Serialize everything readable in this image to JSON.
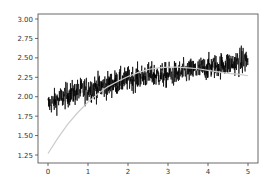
{
  "chart_data": {
    "type": "line",
    "title": "",
    "xlabel": "",
    "ylabel": "",
    "xlim": [
      -0.25,
      5.25
    ],
    "ylim": [
      1.18,
      3.04
    ],
    "xticks": [
      0,
      1,
      2,
      3,
      4,
      5
    ],
    "xtick_labels": [
      "0",
      "1",
      "2",
      "3",
      "4",
      "5"
    ],
    "yticks": [
      1.25,
      1.5,
      1.75,
      2.0,
      2.25,
      2.5,
      2.75,
      3.0
    ],
    "ytick_labels": [
      "1.25",
      "1.50",
      "1.75",
      "2.00",
      "2.25",
      "2.50",
      "2.75",
      "3.00"
    ],
    "grid": false,
    "legend": null,
    "series": [
      {
        "name": "noisy data",
        "color": "#000000",
        "style": "line",
        "description": "dense noisy signal, ~1000 points over x in [0,5], mean rising from ~1.95 to ~2.35, amplitude ~±0.3",
        "envelope": {
          "x": [
            0,
            0.5,
            1,
            1.5,
            2,
            2.5,
            3,
            3.5,
            4,
            4.5,
            5
          ],
          "upper": [
            2.25,
            2.4,
            2.5,
            2.55,
            2.6,
            2.65,
            2.65,
            2.7,
            2.75,
            2.8,
            2.9
          ],
          "lower": [
            1.55,
            1.65,
            1.7,
            1.75,
            1.85,
            1.9,
            1.9,
            1.95,
            2.0,
            2.05,
            2.05
          ]
        }
      },
      {
        "name": "fitted curve",
        "color": "#cccccc",
        "style": "line",
        "x": [
          0,
          0.25,
          0.5,
          0.75,
          1,
          1.25,
          1.5,
          1.75,
          2,
          2.25,
          2.5,
          2.75,
          3,
          3.25,
          3.5,
          3.75,
          4,
          4.25,
          4.5,
          4.75,
          5
        ],
        "y": [
          1.27,
          1.47,
          1.65,
          1.8,
          1.93,
          2.04,
          2.13,
          2.2,
          2.26,
          2.31,
          2.35,
          2.37,
          2.38,
          2.38,
          2.37,
          2.36,
          2.34,
          2.32,
          2.3,
          2.29,
          2.27
        ]
      }
    ]
  }
}
